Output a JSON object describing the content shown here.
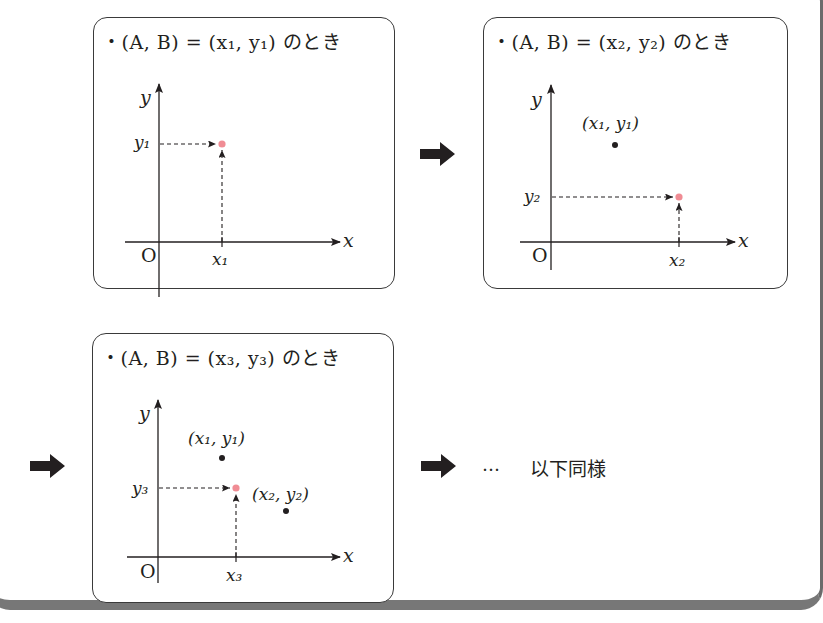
{
  "panels": [
    {
      "id": 1,
      "title": "・(A, B) = (x₁, y₁) のとき",
      "axis_labels": {
        "x": "x",
        "y": "y",
        "origin": "O"
      },
      "tick_labels": {
        "x": "x₁",
        "y": "y₁"
      },
      "current_point": {
        "label": "(x₁, y₁)",
        "color": "#f08c94"
      },
      "previous_points": []
    },
    {
      "id": 2,
      "title": "・(A, B) = (x₂, y₂) のとき",
      "axis_labels": {
        "x": "x",
        "y": "y",
        "origin": "O"
      },
      "tick_labels": {
        "x": "x₂",
        "y": "y₂"
      },
      "current_point": {
        "label": "(x₂, y₂)",
        "color": "#f08c94"
      },
      "previous_points": [
        {
          "label": "(x₁, y₁)"
        }
      ]
    },
    {
      "id": 3,
      "title": "・(A, B) = (x₃, y₃) のとき",
      "axis_labels": {
        "x": "x",
        "y": "y",
        "origin": "O"
      },
      "tick_labels": {
        "x": "x₃",
        "y": "y₃"
      },
      "current_point": {
        "label": "(x₃, y₃)",
        "color": "#f08c94"
      },
      "previous_points": [
        {
          "label": "(x₁, y₁)"
        },
        {
          "label": "(x₂, y₂)"
        }
      ]
    }
  ],
  "continuation": {
    "dots": "…",
    "text": "以下同様"
  },
  "colors": {
    "highlight_point": "#f08c94",
    "point": "#231f20",
    "line": "#231f20",
    "frame": "#6b6b6b"
  }
}
